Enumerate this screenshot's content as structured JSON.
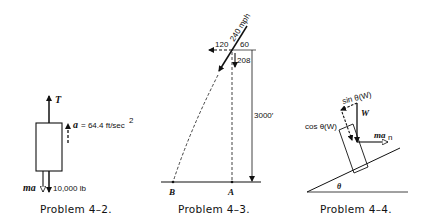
{
  "problems": [
    {
      "caption": "Problem 4–2.",
      "labels": {
        "tension": "T",
        "acceleration": "a",
        "acceleration_value": "= 64.4 ft/sec",
        "acceleration_exp": "2",
        "inertia": "ma",
        "weight": "10,000 lb"
      }
    },
    {
      "caption": "Problem 4–3.",
      "labels": {
        "speed": "240 mph",
        "horizontal": "120",
        "top": "60",
        "vertical": "208",
        "height": "3000′",
        "point_b": "B",
        "point_a": "A"
      }
    },
    {
      "caption": "Problem 4–4.",
      "labels": {
        "sin_component": "sin θ(W)",
        "weight": "W",
        "cos_component": "cos θ(W)",
        "inertia": "ma",
        "inertia_sub": "n",
        "angle": "θ"
      }
    }
  ],
  "colors": {
    "ink": "#111111",
    "background": "#ffffff"
  }
}
